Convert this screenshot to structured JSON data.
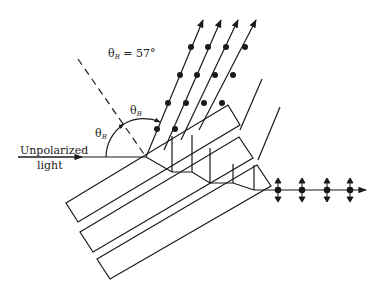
{
  "diagram": {
    "title_label": {
      "symbol": "θ",
      "subscript": "B",
      "value": " = 57°"
    },
    "angle_label_upper": {
      "symbol": "θ",
      "subscript": "B"
    },
    "angle_label_left": {
      "symbol": "θ",
      "subscript": "B"
    },
    "input_label_line1": "Unpolarized",
    "input_label_line2": "light",
    "colors": {
      "stroke": "#1a1a1a",
      "background": "#ffffff"
    },
    "plates": 3,
    "reflected_beams": 4,
    "transmitted_polarization": "in-plane (vertical arrows)",
    "reflected_polarization": "perpendicular (dots)"
  }
}
